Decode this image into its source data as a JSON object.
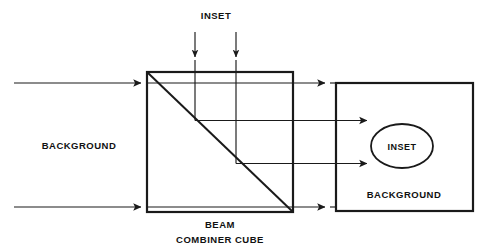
{
  "figure": {
    "type": "optical-schematic",
    "title_visible": false,
    "background_color": "#ffffff",
    "line_color": "#1a1a1a",
    "labels": {
      "inset_top": "INSET",
      "background_left": "BACKGROUND",
      "beam_line1": "BEAM",
      "beam_line2": "COMBINER CUBE",
      "inset_ellipse": "INSET",
      "background_right": "BACKGROUND"
    },
    "components": {
      "cube": {
        "name": "beam-combiner-cube",
        "x": 147,
        "y": 72,
        "width": 146,
        "height": 140,
        "diagonal": "top-left to bottom-right",
        "stroke_width": 2.2
      },
      "output_rect": {
        "name": "output-image-plane",
        "x": 336,
        "y": 83,
        "width": 137,
        "height": 128,
        "stroke_width": 2.2
      },
      "inset_ellipse": {
        "name": "inset-ellipse",
        "cx": 402,
        "cy": 146,
        "rx": 31,
        "ry": 22,
        "stroke_width": 1.8
      }
    },
    "rays": {
      "background_top": {
        "y": 83,
        "x_start": 14,
        "x_end": 330
      },
      "background_bottom": {
        "y": 207,
        "x_start": 14,
        "x_end": 330
      },
      "inset_ray_1": {
        "x": 195,
        "y_start": 32,
        "bend_y": 120,
        "x_end": 372
      },
      "inset_ray_2": {
        "x": 236,
        "y_start": 32,
        "bend_y": 163,
        "x_end": 372
      }
    },
    "arrow_count": 8
  }
}
